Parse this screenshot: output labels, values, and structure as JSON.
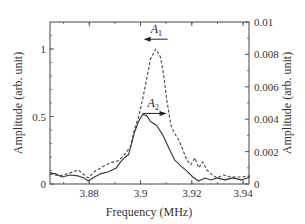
{
  "chart_data": {
    "type": "line",
    "title": "",
    "xlabel": "Frequency (MHz)",
    "ylabel": "Amplitude (arb. unit)",
    "y2label": "Amplitude (arb. unit)",
    "xlim": [
      3.8647,
      3.9423
    ],
    "ylim": [
      0,
      1.2
    ],
    "y2lim": [
      0,
      0.01
    ],
    "grid": false,
    "legend": null,
    "x_ticks": [
      {
        "value": 3.88,
        "label": "3.88"
      },
      {
        "value": 3.9,
        "label": "3.9"
      },
      {
        "value": 3.92,
        "label": "3.92"
      },
      {
        "value": 3.94,
        "label": "3.94"
      }
    ],
    "y_ticks": [
      {
        "value": 0,
        "label": "0"
      },
      {
        "value": 0.5,
        "label": "0.5"
      },
      {
        "value": 1.0,
        "label": "1"
      }
    ],
    "y2_ticks": [
      {
        "value": 0,
        "label": "0"
      },
      {
        "value": 0.002,
        "label": "0.002"
      },
      {
        "value": 0.004,
        "label": "0.004"
      },
      {
        "value": 0.006,
        "label": "0.006"
      },
      {
        "value": 0.008,
        "label": "0.008"
      },
      {
        "value": 0.01,
        "label": "0.01"
      }
    ],
    "series": [
      {
        "name": "A1",
        "style": "dashed",
        "axis": "left",
        "color": "#444444",
        "x": [
          3.8647,
          3.8686,
          3.8725,
          3.8757,
          3.8796,
          3.8824,
          3.8851,
          3.8882,
          3.8914,
          3.8937,
          3.8961,
          3.8976,
          3.8992,
          3.9008,
          3.9024,
          3.9039,
          3.9059,
          3.9078,
          3.909,
          3.9102,
          3.9118,
          3.9133,
          3.9149,
          3.9165,
          3.918,
          3.9196,
          3.9212,
          3.9227,
          3.9243,
          3.9259,
          3.9275,
          3.9298,
          3.9322,
          3.9353,
          3.9392,
          3.9427
        ],
        "y": [
          0.075,
          0.06,
          0.082,
          0.104,
          0.045,
          0.097,
          0.127,
          0.157,
          0.172,
          0.216,
          0.276,
          0.403,
          0.493,
          0.627,
          0.776,
          0.925,
          1.0,
          0.94,
          0.813,
          0.627,
          0.44,
          0.373,
          0.328,
          0.254,
          0.179,
          0.142,
          0.194,
          0.119,
          0.164,
          0.104,
          0.075,
          0.045,
          0.067,
          0.052,
          0.052,
          0.06
        ]
      },
      {
        "name": "A2",
        "style": "solid",
        "axis": "left",
        "color": "#333333",
        "x": [
          3.8647,
          3.8671,
          3.8694,
          3.8725,
          3.8757,
          3.878,
          3.8796,
          3.882,
          3.8843,
          3.8875,
          3.8906,
          3.8922,
          3.8937,
          3.8953,
          3.8961,
          3.8976,
          3.8992,
          3.9008,
          3.9024,
          3.9039,
          3.9063,
          3.9086,
          3.911,
          3.9133,
          3.9157,
          3.918,
          3.9204,
          3.9227,
          3.9251,
          3.9275,
          3.9298,
          3.9329,
          3.9361,
          3.9392,
          3.9427
        ],
        "y": [
          0.082,
          0.075,
          0.052,
          0.067,
          0.06,
          0.045,
          0.022,
          0.052,
          0.075,
          0.09,
          0.119,
          0.164,
          0.194,
          0.216,
          0.269,
          0.381,
          0.463,
          0.515,
          0.507,
          0.463,
          0.433,
          0.366,
          0.269,
          0.179,
          0.134,
          0.097,
          0.052,
          0.022,
          0.045,
          0.03,
          0.045,
          0.03,
          0.045,
          0.03,
          0.052
        ]
      }
    ],
    "annotations": [
      {
        "text": "A",
        "subscript": "1",
        "arrow": "left",
        "x": 3.9059,
        "y": 1.08
      },
      {
        "text": "A",
        "subscript": "2",
        "arrow": "right",
        "x": 3.9047,
        "y": 0.53
      }
    ]
  }
}
